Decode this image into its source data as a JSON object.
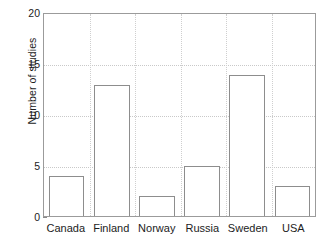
{
  "chart_data": {
    "type": "bar",
    "title": "",
    "subtitle": "",
    "xlabel": "",
    "ylabel": "Number of studies",
    "categories": [
      "Canada",
      "Finland",
      "Norway",
      "Russia",
      "Sweden",
      "USA"
    ],
    "values": [
      4,
      13,
      2,
      5,
      14,
      3
    ],
    "series": [
      {
        "name": "Number of studies",
        "values": [
          4,
          13,
          2,
          5,
          14,
          3
        ]
      }
    ],
    "ylim": [
      0,
      20
    ],
    "yticks": [
      0,
      5,
      10,
      15,
      20
    ],
    "ytick_labels": [
      "0",
      "5",
      "10",
      "15",
      "20"
    ],
    "grid": "dotted light gray, horizontal at y ticks and vertical between categories",
    "legend": "none",
    "legend_position": "none",
    "bar_fill_color": "#ffffff",
    "bar_edge_color": "#8d8d8d",
    "axis_color": "#9b9b9b",
    "grid_color": "#c9c9c9",
    "background_color": "#ffffff",
    "text_color": "#1c1c1c"
  },
  "axes": {
    "y_title": "Number of studies",
    "y_ticks": [
      {
        "label": "20",
        "value": 20
      },
      {
        "label": "15",
        "value": 15
      },
      {
        "label": "10",
        "value": 10
      },
      {
        "label": "5",
        "value": 5
      },
      {
        "label": "0",
        "value": 0
      }
    ],
    "x_labels": [
      "Canada",
      "Finland",
      "Norway",
      "Russia",
      "Sweden",
      "USA"
    ]
  }
}
